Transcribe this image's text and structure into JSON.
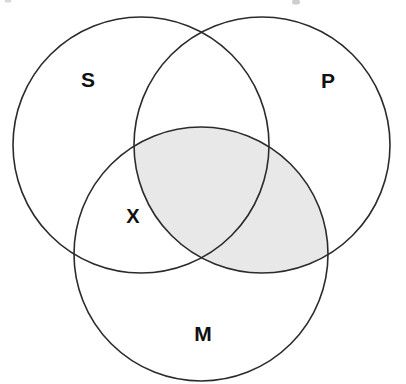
{
  "diagram": {
    "type": "venn-3-set",
    "background_color": "#ffffff",
    "stroke_color": "#2b2b2b",
    "stroke_width": 1.6,
    "label_color": "#111111",
    "shade_color": "#e8e8e8",
    "canvas": {
      "width": 406,
      "height": 384
    }
  },
  "circles": [
    {
      "id": "S",
      "label": "S",
      "cx": 141,
      "cy": 145,
      "r": 128,
      "label_x": 88,
      "label_y": 79,
      "label_size": 21
    },
    {
      "id": "P",
      "label": "P",
      "cx": 262,
      "cy": 145,
      "r": 128,
      "label_x": 328,
      "label_y": 80,
      "label_size": 21
    },
    {
      "id": "M",
      "label": "M",
      "cx": 201,
      "cy": 254,
      "r": 127,
      "label_x": 203,
      "label_y": 333,
      "label_size": 21
    }
  ],
  "marks": [
    {
      "id": "X",
      "label": "X",
      "x": 133,
      "y": 216,
      "size": 20,
      "region": "S-and-M-only"
    }
  ],
  "shaded_regions": [
    {
      "id": "P-and-M",
      "description": "Intersection of circle P and circle M",
      "color": "#e8e8e8"
    }
  ],
  "artifacts": [
    {
      "id": "scan-speck-left",
      "x": 8,
      "y": 1,
      "rx": 3.5,
      "ry": 1.6
    },
    {
      "id": "scan-speck-right",
      "x": 296,
      "y": 2,
      "rx": 4,
      "ry": 2.6
    }
  ]
}
